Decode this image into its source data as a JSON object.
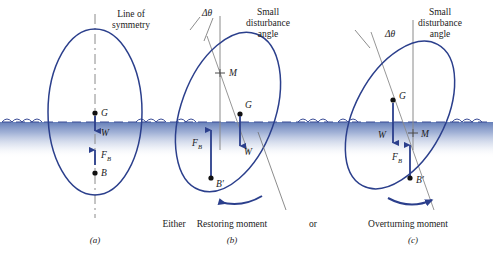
{
  "figure": {
    "title_a": "Line of\nsymmetry",
    "title_a_line1": "Line of",
    "title_a_line2": "symmetry",
    "title_b_line1": "Small",
    "title_b_line2": "disturbance",
    "title_b_line3": "angle",
    "title_c_line1": "Small",
    "title_c_line2": "disturbance",
    "title_c_line3": "angle",
    "delta_theta_b": "Δθ",
    "delta_theta_c": "Δθ"
  },
  "colors": {
    "hull_stroke": "#2b3f8c",
    "water_fill_top": "#5d78b5",
    "water_fill_bottom": "#ffffff",
    "water_dash": "#3a4c96",
    "force_arrow": "#2b3f8c",
    "point_dot": "#111111",
    "axis_gray": "#8a8a8a",
    "text": "#1b1b1b",
    "background": "#ffffff"
  },
  "panels": [
    {
      "id": "a",
      "caption": "(a)",
      "moment_label": "",
      "points": [
        {
          "name": "G",
          "label": "G",
          "sub": ""
        },
        {
          "name": "B",
          "label": "B",
          "sub": ""
        }
      ],
      "forces": [
        {
          "name": "W",
          "label": "W",
          "sub": "",
          "direction": "down"
        },
        {
          "name": "FB",
          "label": "F",
          "sub": "B",
          "direction": "up"
        }
      ]
    },
    {
      "id": "b",
      "caption": "(b)",
      "moment_label": "Restoring moment",
      "points": [
        {
          "name": "M",
          "label": "M",
          "sub": ""
        },
        {
          "name": "G",
          "label": "G",
          "sub": ""
        },
        {
          "name": "Bprime",
          "label": "B′",
          "sub": ""
        }
      ],
      "forces": [
        {
          "name": "W",
          "label": "W",
          "sub": "",
          "direction": "down"
        },
        {
          "name": "FB",
          "label": "F",
          "sub": "B",
          "direction": "up"
        }
      ],
      "rotation_sense": "counterclockwise"
    },
    {
      "id": "c",
      "caption": "(c)",
      "moment_label": "Overturning moment",
      "points": [
        {
          "name": "G",
          "label": "G",
          "sub": ""
        },
        {
          "name": "M",
          "label": "M",
          "sub": ""
        },
        {
          "name": "Bprime",
          "label": "B′",
          "sub": ""
        }
      ],
      "forces": [
        {
          "name": "W",
          "label": "W",
          "sub": "",
          "direction": "down"
        },
        {
          "name": "FB",
          "label": "F",
          "sub": "B",
          "direction": "up"
        }
      ],
      "rotation_sense": "clockwise"
    }
  ],
  "connectors": {
    "either": "Either",
    "or": "or"
  },
  "labels": {
    "M": "M",
    "G": "G",
    "B": "B",
    "Bprime": "B′",
    "W": "W",
    "F": "F",
    "B_sub": "B"
  }
}
